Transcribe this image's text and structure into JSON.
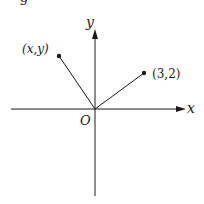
{
  "diagram": {
    "type": "coordinate-plane-vectors",
    "top_partial_text": "g",
    "axes": {
      "x_label": "x",
      "y_label": "y",
      "origin_label": "O"
    },
    "points": [
      {
        "label": "(x,y)",
        "description": "unknown point in second quadrant"
      },
      {
        "label": "(3,2)",
        "description": "point in first quadrant"
      }
    ],
    "colors": {
      "line": "#1a1a1a",
      "background": "#ffffff"
    }
  }
}
